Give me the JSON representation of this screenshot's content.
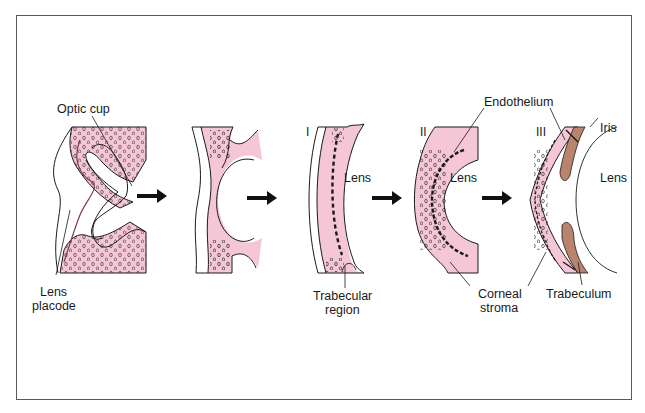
{
  "figure": {
    "colors": {
      "mesenchyme_pink": "#f4c6d6",
      "iris_brown": "#b9836e",
      "outline": "#1a1a1a",
      "frame": "#5a5a5a"
    },
    "stages": [
      {
        "id": "stage-0",
        "roman": "",
        "labels": [
          "Optic cup",
          "Lens placode"
        ]
      },
      {
        "id": "stage-1",
        "roman": "",
        "labels": []
      },
      {
        "id": "stage-I",
        "roman": "I",
        "labels": [
          "Lens",
          "Trabecular region"
        ]
      },
      {
        "id": "stage-II",
        "roman": "II",
        "labels": [
          "Lens",
          "Endothelium",
          "Corneal stroma"
        ]
      },
      {
        "id": "stage-III",
        "roman": "III",
        "labels": [
          "Iris",
          "Lens",
          "Trabeculum"
        ]
      }
    ]
  },
  "labels": {
    "optic_cup": "Optic cup",
    "lens_placode_1": "Lens",
    "lens_placode_2": "placode",
    "stage_I": "I",
    "stage_II": "II",
    "stage_III": "III",
    "lens_I": "Lens",
    "lens_II": "Lens",
    "lens_III": "Lens",
    "trabecular_1": "Trabecular",
    "trabecular_2": "region",
    "endothelium": "Endothelium",
    "iris": "Iris",
    "corneal_1": "Corneal",
    "corneal_2": "stroma",
    "trabeculum": "Trabeculum"
  },
  "arrows": [
    "stage-0→stage-1",
    "stage-1→stage-I",
    "stage-I→stage-II",
    "stage-II→stage-III"
  ]
}
